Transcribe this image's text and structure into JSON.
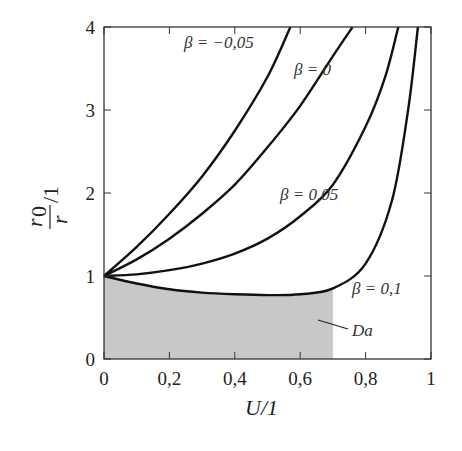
{
  "chart_data": {
    "type": "line",
    "title": "",
    "xlabel": "U/1",
    "ylabel": "r0/r / 1",
    "xlim": [
      0,
      1
    ],
    "ylim": [
      0,
      4
    ],
    "grid": false,
    "legend": "none (inline annotations)",
    "x_ticks": [
      "0",
      "0,2",
      "0,4",
      "0,6",
      "0,8",
      "1"
    ],
    "y_ticks": [
      "0",
      "1",
      "2",
      "3",
      "4"
    ],
    "series": [
      {
        "name": "β = −0,05",
        "label": "β = −0,05",
        "x": [
          0,
          0.1,
          0.2,
          0.3,
          0.4,
          0.5,
          0.57
        ],
        "y": [
          1,
          1.35,
          1.75,
          2.2,
          2.75,
          3.4,
          4.0
        ]
      },
      {
        "name": "β = 0",
        "label": "β = 0",
        "x": [
          0,
          0.1,
          0.2,
          0.3,
          0.4,
          0.5,
          0.6,
          0.7,
          0.76
        ],
        "y": [
          1,
          1.2,
          1.45,
          1.75,
          2.1,
          2.55,
          3.05,
          3.65,
          4.0
        ]
      },
      {
        "name": "β = 0,05",
        "label": "β = 0,05",
        "x": [
          0,
          0.1,
          0.2,
          0.3,
          0.4,
          0.5,
          0.6,
          0.7,
          0.8,
          0.86,
          0.9
        ],
        "y": [
          1,
          1.02,
          1.07,
          1.15,
          1.27,
          1.45,
          1.72,
          2.1,
          2.8,
          3.4,
          4.0
        ]
      },
      {
        "name": "β = 0,1",
        "label": "β = 0,1",
        "x": [
          0,
          0.1,
          0.2,
          0.3,
          0.4,
          0.5,
          0.6,
          0.7,
          0.8,
          0.88,
          0.93,
          0.96
        ],
        "y": [
          1,
          0.91,
          0.84,
          0.8,
          0.78,
          0.77,
          0.78,
          0.85,
          1.15,
          1.9,
          3.0,
          4.0
        ]
      }
    ],
    "shaded_region": {
      "label": "Da",
      "x_range": [
        0,
        0.7
      ],
      "bounded_above_by": "β = 0,1",
      "color": "#c8c8c8"
    },
    "annotations": [
      {
        "text": "β = −0,05",
        "x": 0.25,
        "y": 3.85
      },
      {
        "text": "β = 0",
        "x": 0.58,
        "y": 3.45
      },
      {
        "text": "β = 0,05",
        "x": 0.53,
        "y": 2.0
      },
      {
        "text": "β = 0,1",
        "x": 0.76,
        "y": 0.85
      },
      {
        "text": "Da",
        "x": 0.77,
        "y": 0.4
      }
    ]
  },
  "labels": {
    "xlabel": "U/1",
    "ylabel_num": "r",
    "ylabel_sub": "0",
    "ylabel_den": "r",
    "ylabel_rest": "/1",
    "da": "Da",
    "beta_m005": "β = −0,05",
    "beta_0": "β = 0",
    "beta_005": "β = 0,05",
    "beta_01": "β = 0,1"
  },
  "colors": {
    "line": "#111111",
    "frame": "#333333",
    "shade": "#c8c8c8"
  }
}
